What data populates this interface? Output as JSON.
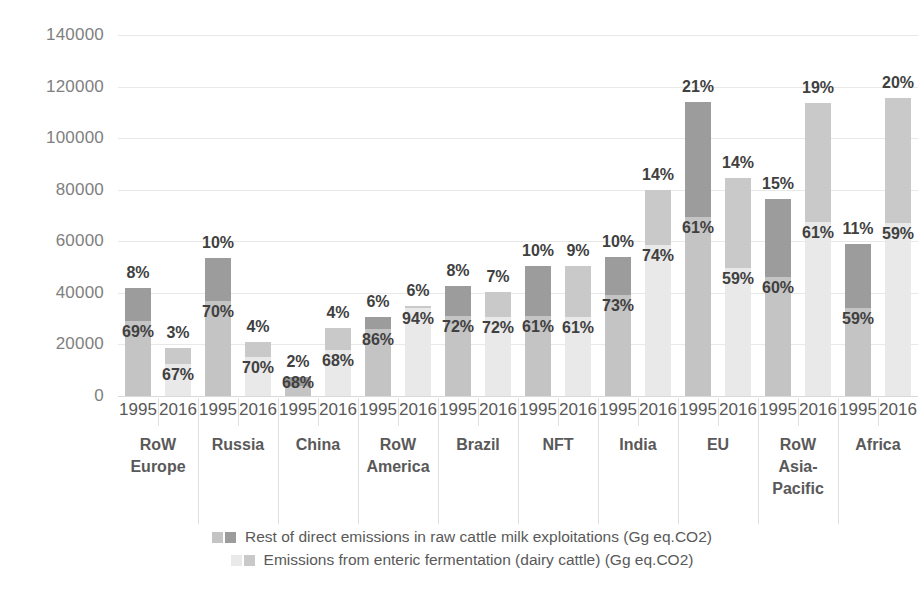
{
  "chart_data": {
    "type": "bar",
    "title": "",
    "xlabel": "",
    "ylabel": "",
    "ylim": [
      0,
      140000
    ],
    "yticks": [
      0,
      20000,
      40000,
      60000,
      80000,
      100000,
      120000,
      140000
    ],
    "ytick_labels": [
      "0",
      "20000",
      "40000",
      "60000",
      "80000",
      "100000",
      "120000",
      "140000"
    ],
    "grid": true,
    "stacked": true,
    "legend_position": "bottom",
    "legend": [
      "Rest of direct emissions in raw cattle milk exploitations (Gg eq.CO2)",
      "Emissions from enteric fermentation (dairy cattle) (Gg eq.CO2)"
    ],
    "series": [
      {
        "name": "Emissions from enteric fermentation (dairy cattle) (Gg eq.CO2)",
        "values": [
          29000,
          12500,
          37000,
          15000,
          4000,
          18000,
          26000,
          34000,
          31000,
          30500,
          31000,
          30500,
          39000,
          58500,
          69500,
          49500,
          46000,
          67500,
          34000,
          67000
        ]
      },
      {
        "name": "Rest of direct emissions in raw cattle milk exploitations (Gg eq.CO2)",
        "values": [
          13000,
          6000,
          16500,
          6000,
          3500,
          8500,
          4500,
          1000,
          11500,
          10000,
          19500,
          20000,
          15000,
          21500,
          44500,
          35000,
          30500,
          46000,
          25000,
          48500
        ]
      }
    ],
    "bars": [
      {
        "region": "RoW Europe",
        "year": "1995",
        "enteric": 29000,
        "rest": 13000,
        "total": 42000,
        "pct_top": "8%",
        "pct_in": "69%",
        "shade": "dark"
      },
      {
        "region": "RoW Europe",
        "year": "2016",
        "enteric": 12500,
        "rest": 6000,
        "total": 18500,
        "pct_top": "3%",
        "pct_in": "67%",
        "shade": "light"
      },
      {
        "region": "Russia",
        "year": "1995",
        "enteric": 37000,
        "rest": 16500,
        "total": 53500,
        "pct_top": "10%",
        "pct_in": "70%",
        "shade": "dark"
      },
      {
        "region": "Russia",
        "year": "2016",
        "enteric": 15000,
        "rest": 6000,
        "total": 21000,
        "pct_top": "4%",
        "pct_in": "70%",
        "shade": "light"
      },
      {
        "region": "China",
        "year": "1995",
        "enteric": 4000,
        "rest": 3500,
        "total": 7500,
        "pct_top": "2%",
        "pct_in": "68%",
        "shade": "dark"
      },
      {
        "region": "China",
        "year": "2016",
        "enteric": 18000,
        "rest": 8500,
        "total": 26500,
        "pct_top": "4%",
        "pct_in": "68%",
        "shade": "light"
      },
      {
        "region": "RoW America",
        "year": "1995",
        "enteric": 26000,
        "rest": 4500,
        "total": 30500,
        "pct_top": "6%",
        "pct_in": "86%",
        "shade": "dark"
      },
      {
        "region": "RoW America",
        "year": "2016",
        "enteric": 34000,
        "rest": 1000,
        "total": 35000,
        "pct_top": "6%",
        "pct_in": "94%",
        "shade": "light"
      },
      {
        "region": "Brazil",
        "year": "1995",
        "enteric": 31000,
        "rest": 11500,
        "total": 42500,
        "pct_top": "8%",
        "pct_in": "72%",
        "shade": "dark"
      },
      {
        "region": "Brazil",
        "year": "2016",
        "enteric": 30500,
        "rest": 10000,
        "total": 40500,
        "pct_top": "7%",
        "pct_in": "72%",
        "shade": "light"
      },
      {
        "region": "NFT",
        "year": "1995",
        "enteric": 31000,
        "rest": 19500,
        "total": 50500,
        "pct_top": "10%",
        "pct_in": "61%",
        "shade": "dark"
      },
      {
        "region": "NFT",
        "year": "2016",
        "enteric": 30500,
        "rest": 20000,
        "total": 50500,
        "pct_top": "9%",
        "pct_in": "61%",
        "shade": "light"
      },
      {
        "region": "India",
        "year": "1995",
        "enteric": 39000,
        "rest": 15000,
        "total": 54000,
        "pct_top": "10%",
        "pct_in": "73%",
        "shade": "dark"
      },
      {
        "region": "India",
        "year": "2016",
        "enteric": 58500,
        "rest": 21500,
        "total": 80000,
        "pct_top": "14%",
        "pct_in": "74%",
        "shade": "light"
      },
      {
        "region": "EU",
        "year": "1995",
        "enteric": 69500,
        "rest": 44500,
        "total": 114000,
        "pct_top": "21%",
        "pct_in": "61%",
        "shade": "dark"
      },
      {
        "region": "EU",
        "year": "2016",
        "enteric": 49500,
        "rest": 35000,
        "total": 84500,
        "pct_top": "14%",
        "pct_in": "59%",
        "shade": "light"
      },
      {
        "region": "RoW Asia-Pacific",
        "year": "1995",
        "enteric": 46000,
        "rest": 30500,
        "total": 76500,
        "pct_top": "15%",
        "pct_in": "60%",
        "shade": "dark"
      },
      {
        "region": "RoW Asia-Pacific",
        "year": "2016",
        "enteric": 67500,
        "rest": 46000,
        "total": 113500,
        "pct_top": "19%",
        "pct_in": "61%",
        "shade": "light"
      },
      {
        "region": "Africa",
        "year": "1995",
        "enteric": 34000,
        "rest": 25000,
        "total": 59000,
        "pct_top": "11%",
        "pct_in": "59%",
        "shade": "dark"
      },
      {
        "region": "Africa",
        "year": "2016",
        "enteric": 67000,
        "rest": 48500,
        "total": 115500,
        "pct_top": "20%",
        "pct_in": "59%",
        "shade": "light"
      }
    ],
    "regions": [
      {
        "label": "RoW\nEurope",
        "lines": [
          "RoW",
          "Europe"
        ]
      },
      {
        "label": "Russia",
        "lines": [
          "Russia"
        ]
      },
      {
        "label": "China",
        "lines": [
          "China"
        ]
      },
      {
        "label": "RoW\nAmerica",
        "lines": [
          "RoW",
          "America"
        ]
      },
      {
        "label": "Brazil",
        "lines": [
          "Brazil"
        ]
      },
      {
        "label": "NFT",
        "lines": [
          "NFT"
        ]
      },
      {
        "label": "India",
        "lines": [
          "India"
        ]
      },
      {
        "label": "EU",
        "lines": [
          "EU"
        ]
      },
      {
        "label": "RoW\nAsia-\nPacific",
        "lines": [
          "RoW",
          "Asia-",
          "Pacific"
        ]
      },
      {
        "label": "Africa",
        "lines": [
          "Africa"
        ]
      }
    ],
    "years": [
      "1995",
      "2016"
    ]
  },
  "colors": {
    "rest_dark": "#9c9c9c",
    "rest_light": "#c9c9c9",
    "enteric_dark": "#c4c4c4",
    "enteric_light": "#e9e9e9",
    "gridline": "#e8e8e8",
    "axis_text": "#808080",
    "label_text": "#404040",
    "background": "#ffffff"
  }
}
